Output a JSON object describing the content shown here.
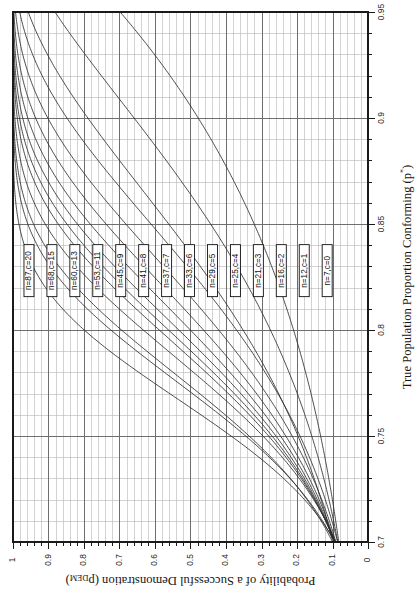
{
  "figure": {
    "name": "oc-curve-chart",
    "rotation_deg": 90,
    "background": "#ffffff",
    "frame_color": "#1a1a1a",
    "major_grid_color": "#6e6e6e",
    "minor_grid_color": "#b5b5b5",
    "curve_color": "#2a2a2a"
  },
  "chart_data": {
    "type": "line",
    "title": "",
    "xlabel": "True Population Proportion Conforming (p*)",
    "xlabel_plain": "True Population Proportion Conforming",
    "xlabel_symbol": "(p",
    "xlabel_symbol_sup": "*",
    "xlabel_symbol_close": ")",
    "ylabel": "Probability of a Successful Demonstration (pDEM)",
    "ylabel_plain": "Probability of a Successful Demonstration (p",
    "ylabel_sub": "DEM",
    "ylabel_close": ")",
    "xlim": [
      0.7,
      0.95
    ],
    "ylim": [
      0,
      1
    ],
    "x_major_step": 0.05,
    "x_minor_step": 0.01,
    "y_major_step": 0.1,
    "y_minor_step": 0.02,
    "grid": true,
    "legend_position": "inline-boxed-labels",
    "xticks": [
      0.7,
      0.75,
      0.8,
      0.85,
      0.9,
      0.95
    ],
    "xtick_labels": [
      "0.7",
      "0.75",
      "0.8",
      "0.85",
      "0.9",
      "0.95"
    ],
    "yticks": [
      0,
      0.1,
      0.2,
      0.3,
      0.4,
      0.5,
      0.6,
      0.7,
      0.8,
      0.9,
      1
    ],
    "ytick_labels": [
      "0",
      "0.1",
      "0.2",
      "0.3",
      "0.4",
      "0.5",
      "0.6",
      "0.7",
      "0.8",
      "0.9",
      "1"
    ],
    "x": [
      0.7,
      0.71,
      0.72,
      0.73,
      0.74,
      0.75,
      0.76,
      0.77,
      0.78,
      0.79,
      0.8,
      0.81,
      0.82,
      0.83,
      0.84,
      0.85,
      0.86,
      0.87,
      0.88,
      0.89,
      0.9,
      0.91,
      0.92,
      0.93,
      0.94,
      0.95
    ],
    "series": [
      {
        "name": "n=7,c=0",
        "n": 7,
        "c": 0,
        "label": "n=7,c=0",
        "values": [
          0.082,
          0.095,
          0.11,
          0.128,
          0.147,
          0.167,
          0.19,
          0.215,
          0.242,
          0.272,
          0.21,
          0.236,
          0.264,
          0.295,
          0.328,
          0.321,
          0.354,
          0.389,
          0.427,
          0.467,
          0.478,
          0.52,
          0.565,
          0.612,
          0.648,
          0.698
        ]
      },
      {
        "name": "n=12,c=1",
        "n": 12,
        "c": 1,
        "label": "n=12,c=1",
        "values": [
          0.085,
          0.101,
          0.12,
          0.141,
          0.166,
          0.194,
          0.225,
          0.26,
          0.299,
          0.342,
          0.39,
          0.441,
          0.497,
          0.556,
          0.619,
          0.443,
          0.49,
          0.54,
          0.592,
          0.645,
          0.659,
          0.712,
          0.766,
          0.818,
          0.863,
          0.882
        ]
      },
      {
        "name": "n=16,c=2",
        "n": 16,
        "c": 2,
        "label": "n=16,c=2",
        "values": [
          0.099,
          0.118,
          0.141,
          0.167,
          0.197,
          0.232,
          0.271,
          0.315,
          0.364,
          0.418,
          0.477,
          0.541,
          0.609,
          0.68,
          0.752,
          0.545,
          0.603,
          0.663,
          0.723,
          0.78,
          0.79,
          0.841,
          0.885,
          0.923,
          0.952,
          0.951
        ]
      },
      {
        "name": "n=21,c=3",
        "n": 21,
        "c": 3,
        "label": "n=21,c=3",
        "values": [
          0.095,
          0.114,
          0.138,
          0.166,
          0.199,
          0.238,
          0.283,
          0.334,
          0.392,
          0.457,
          0.528,
          0.604,
          0.684,
          0.763,
          0.837,
          0.618,
          0.683,
          0.746,
          0.805,
          0.857,
          0.862,
          0.903,
          0.937,
          0.963,
          0.98,
          0.977
        ]
      },
      {
        "name": "n=25,c=4",
        "n": 25,
        "c": 4,
        "label": "n=25,c=4",
        "values": [
          0.11,
          0.134,
          0.163,
          0.197,
          0.238,
          0.286,
          0.341,
          0.403,
          0.471,
          0.545,
          0.623,
          0.702,
          0.779,
          0.849,
          0.908,
          0.684,
          0.748,
          0.806,
          0.856,
          0.898,
          0.906,
          0.936,
          0.96,
          0.978,
          0.989,
          0.989
        ]
      },
      {
        "name": "n=29,c=5",
        "n": 29,
        "c": 5,
        "label": "n=29,c=5",
        "values": [
          0.114,
          0.14,
          0.172,
          0.211,
          0.257,
          0.311,
          0.373,
          0.443,
          0.518,
          0.597,
          0.677,
          0.754,
          0.823,
          0.882,
          0.927,
          0.736,
          0.795,
          0.846,
          0.889,
          0.923,
          0.931,
          0.954,
          0.972,
          0.985,
          0.993,
          0.994
        ]
      },
      {
        "name": "n=33,c=6",
        "n": 33,
        "c": 6,
        "label": "n=33,c=6",
        "values": [
          0.114,
          0.142,
          0.177,
          0.22,
          0.271,
          0.331,
          0.399,
          0.476,
          0.556,
          0.638,
          0.718,
          0.791,
          0.853,
          0.903,
          0.94,
          0.777,
          0.831,
          0.876,
          0.912,
          0.94,
          0.947,
          0.966,
          0.98,
          0.989,
          0.995,
          0.996
        ]
      },
      {
        "name": "n=37,c=7",
        "n": 37,
        "c": 7,
        "label": "n=37,c=7",
        "values": [
          0.112,
          0.142,
          0.18,
          0.227,
          0.283,
          0.349,
          0.424,
          0.506,
          0.591,
          0.675,
          0.753,
          0.821,
          0.876,
          0.918,
          0.949,
          0.81,
          0.857,
          0.897,
          0.928,
          0.951,
          0.958,
          0.973,
          0.985,
          0.992,
          0.997,
          0.997
        ]
      },
      {
        "name": "n=41,c=8",
        "n": 41,
        "c": 8,
        "label": "n=41,c=8",
        "values": [
          0.109,
          0.141,
          0.182,
          0.233,
          0.294,
          0.366,
          0.447,
          0.534,
          0.622,
          0.706,
          0.781,
          0.843,
          0.892,
          0.929,
          0.955,
          0.837,
          0.879,
          0.914,
          0.94,
          0.96,
          0.966,
          0.978,
          0.988,
          0.994,
          0.998,
          0.998
        ]
      },
      {
        "name": "n=45,c=9",
        "n": 45,
        "c": 9,
        "label": "n=45,c=9",
        "values": [
          0.105,
          0.139,
          0.182,
          0.237,
          0.303,
          0.381,
          0.468,
          0.56,
          0.65,
          0.733,
          0.804,
          0.861,
          0.905,
          0.937,
          0.96,
          0.859,
          0.897,
          0.928,
          0.95,
          0.967,
          0.972,
          0.982,
          0.99,
          0.995,
          0.998,
          0.998
        ]
      },
      {
        "name": "n=53,c=11",
        "n": 53,
        "c": 11,
        "label": "n=53,c=11",
        "values": [
          0.101,
          0.138,
          0.187,
          0.25,
          0.326,
          0.415,
          0.513,
          0.612,
          0.706,
          0.787,
          0.851,
          0.899,
          0.934,
          0.958,
          0.974,
          0.893,
          0.923,
          0.947,
          0.964,
          0.977,
          0.98,
          0.987,
          0.993,
          0.997,
          0.999,
          0.999
        ]
      },
      {
        "name": "n=60,c=13",
        "n": 60,
        "c": 13,
        "label": "n=60,c=13",
        "values": [
          0.101,
          0.142,
          0.196,
          0.266,
          0.352,
          0.45,
          0.555,
          0.658,
          0.749,
          0.823,
          0.88,
          0.92,
          0.948,
          0.967,
          0.98,
          0.917,
          0.941,
          0.959,
          0.973,
          0.982,
          0.985,
          0.991,
          0.995,
          0.998,
          0.999,
          0.999
        ]
      },
      {
        "name": "n=68,c=15",
        "n": 68,
        "c": 15,
        "label": "n=68,c=15",
        "values": [
          0.096,
          0.139,
          0.197,
          0.273,
          0.366,
          0.472,
          0.583,
          0.687,
          0.776,
          0.845,
          0.896,
          0.931,
          0.955,
          0.971,
          0.982,
          0.932,
          0.953,
          0.968,
          0.979,
          0.987,
          0.989,
          0.993,
          0.996,
          0.998,
          1.0,
          1.0
        ]
      },
      {
        "name": "n=87,c=20",
        "n": 87,
        "c": 20,
        "label": "n=87,c=20",
        "values": [
          0.096,
          0.147,
          0.219,
          0.313,
          0.425,
          0.546,
          0.665,
          0.767,
          0.846,
          0.902,
          0.939,
          0.963,
          0.978,
          0.987,
          0.992,
          0.96,
          0.973,
          0.982,
          0.989,
          0.993,
          0.994,
          0.997,
          0.998,
          0.999,
          1.0,
          1.0
        ]
      }
    ],
    "annotations": [
      {
        "text": "n=87,c=20",
        "at_p": 0.828,
        "order": 0
      },
      {
        "text": "n=68,c=15",
        "at_p": 0.828,
        "order": 1
      },
      {
        "text": "n=60,c=13",
        "at_p": 0.828,
        "order": 2
      },
      {
        "text": "n=53,c=11",
        "at_p": 0.828,
        "order": 3
      },
      {
        "text": "n=45,c=9",
        "at_p": 0.828,
        "order": 4
      },
      {
        "text": "n=41,c=8",
        "at_p": 0.828,
        "order": 5
      },
      {
        "text": "n=37,c=7",
        "at_p": 0.828,
        "order": 6
      },
      {
        "text": "n=33,c=6",
        "at_p": 0.828,
        "order": 7
      },
      {
        "text": "n=29,c=5",
        "at_p": 0.828,
        "order": 8
      },
      {
        "text": "n=25,c=4",
        "at_p": 0.828,
        "order": 9
      },
      {
        "text": "n=21,c=3",
        "at_p": 0.828,
        "order": 10
      },
      {
        "text": "n=16,c=2",
        "at_p": 0.828,
        "order": 11
      },
      {
        "text": "n=12,c=1",
        "at_p": 0.828,
        "order": 12
      },
      {
        "text": "n=7,c=0",
        "at_p": 0.828,
        "order": 13
      }
    ]
  }
}
